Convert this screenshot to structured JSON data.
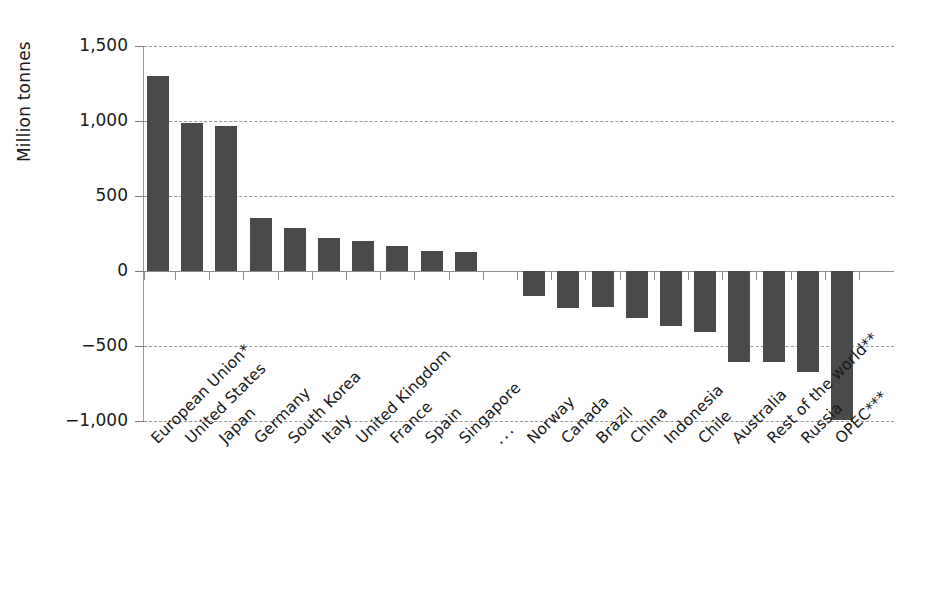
{
  "chart_data": {
    "type": "bar",
    "title": "",
    "xlabel": "",
    "ylabel": "Million tonnes",
    "ylim": [
      -1000,
      1500
    ],
    "yticks": [
      1500,
      1000,
      500,
      0,
      -500,
      -1000
    ],
    "ytick_labels": [
      "1,500",
      "1,000",
      "500",
      "0",
      "−500",
      "−1,000"
    ],
    "grid": true,
    "legend": "none",
    "units": "Million tonnes",
    "categories": [
      "European Union*",
      "United States",
      "Japan",
      "Germany",
      "South Korea",
      "Italy",
      "United Kingdom",
      "France",
      "Spain",
      "Singapore",
      "...",
      "Norway",
      "Canada",
      "Brazil",
      "China",
      "Indonesia",
      "Chile",
      "Australia",
      "Rest of the world**",
      "Russia",
      "OPEC***"
    ],
    "values": [
      1300,
      985,
      965,
      355,
      290,
      222,
      200,
      168,
      135,
      128,
      null,
      -165,
      -245,
      -240,
      -313,
      -365,
      -408,
      -608,
      -608,
      -673,
      -995
    ],
    "bar_color": "#4a4a4a",
    "gridline_color": "#9a9a9a",
    "axis_color": "#8d8d8d"
  },
  "footnotes": {
    "star1": "*",
    "star2": "**",
    "star3": "***"
  }
}
